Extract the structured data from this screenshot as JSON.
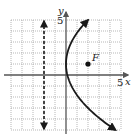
{
  "chart_data": {
    "type": "line",
    "title": "",
    "xlabel": "x",
    "ylabel": "y",
    "xlim": [
      -5,
      5
    ],
    "ylim": [
      -5,
      5
    ],
    "grid": true,
    "x_tick_labels": [
      {
        "value": 5,
        "label": "5"
      }
    ],
    "y_tick_labels": [
      {
        "value": 5,
        "label": "5"
      }
    ],
    "series": [
      {
        "name": "parabola",
        "equation": "(y-1)^2 = 8x",
        "style": "solid",
        "arrows": "both-ends",
        "y_range": [
          -5,
          5
        ],
        "vertex": [
          0,
          1
        ]
      },
      {
        "name": "directrix",
        "equation": "x = -2",
        "style": "dashed",
        "arrows": "both-ends",
        "y_range": [
          -5,
          5
        ]
      }
    ],
    "points": [
      {
        "name": "focus",
        "label": "F",
        "x": 2,
        "y": 1
      }
    ],
    "annotations": [
      "F"
    ]
  }
}
